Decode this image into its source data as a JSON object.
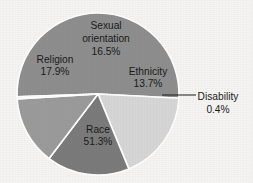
{
  "chart_data": {
    "type": "pie",
    "title": "",
    "subtitle": "",
    "xlabel": "",
    "ylabel": "",
    "legend_position": "none",
    "grid": false,
    "units": "percent",
    "total": 100,
    "categories": [
      "Race",
      "Religion",
      "Sexual orientation",
      "Ethnicity",
      "Disability"
    ],
    "values": [
      51.3,
      17.9,
      16.5,
      13.7,
      0.4
    ],
    "slices": [
      {
        "label": "Race",
        "value": 51.3,
        "value_text": "51.3%",
        "color": "#8e8e8e",
        "label_placement": "inside",
        "label_x": 98,
        "label_y": 130,
        "value_x": 98,
        "value_y": 142
      },
      {
        "label": "Religion",
        "value": 17.9,
        "value_text": "17.9%",
        "color": "#d6d6d6",
        "label_placement": "inside",
        "label_x": 55,
        "label_y": 60,
        "value_x": 55,
        "value_y": 72
      },
      {
        "label": "Sexual",
        "label_line2": "orientation",
        "full_label": "Sexual orientation",
        "value": 16.5,
        "value_text": "16.5%",
        "color": "#7b7b7b",
        "label_placement": "inside",
        "label_x": 106,
        "label_y": 26,
        "label2_x": 106,
        "label2_y": 39,
        "value_x": 106,
        "value_y": 52
      },
      {
        "label": "Ethnicity",
        "value": 13.7,
        "value_text": "13.7%",
        "color": "#9b9b9b",
        "label_placement": "inside",
        "label_x": 148,
        "label_y": 72,
        "value_x": 148,
        "value_y": 84
      },
      {
        "label": "Disability",
        "value": 0.4,
        "value_text": "0.4%",
        "color": "#b0b0b0",
        "label_placement": "callout",
        "label_x": 218,
        "label_y": 97,
        "value_x": 218,
        "value_y": 110
      }
    ],
    "geometry": {
      "center_x": 98,
      "center_y": 94,
      "radius": 81,
      "start_angle_deg": 178,
      "direction": "clockwise",
      "separator_color": "#ffffff",
      "separator_width": 1.6
    },
    "callout": {
      "line_color": "#1b1b1b",
      "line_x1": 162,
      "line_y1": 95,
      "line_x2": 196,
      "line_y2": 95
    },
    "background_color": "#f5f4f2"
  }
}
